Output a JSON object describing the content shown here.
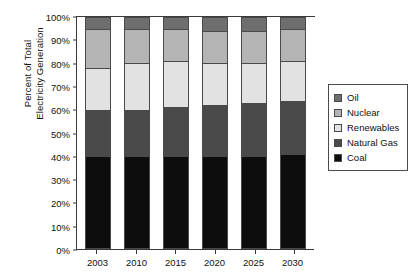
{
  "chart_data": {
    "type": "bar",
    "subtype": "stacked-bar-100-percent",
    "title": "",
    "xlabel": "",
    "ylabel": "Percent of Total\nElectricity Generation",
    "categories": [
      "2003",
      "2010",
      "2015",
      "2020",
      "2025",
      "2030"
    ],
    "ylim": [
      0,
      100
    ],
    "ytick_labels": [
      "0%",
      "10%",
      "20%",
      "30%",
      "40%",
      "50%",
      "60%",
      "70%",
      "80%",
      "90%",
      "100%"
    ],
    "ytick_values": [
      0,
      10,
      20,
      30,
      40,
      50,
      60,
      70,
      80,
      90,
      100
    ],
    "grid": false,
    "legend_position": "right",
    "stack_order_bottom_to_top": [
      "Coal",
      "Natural Gas",
      "Renewables",
      "Nuclear",
      "Oil"
    ],
    "series": [
      {
        "name": "Coal",
        "color": "#0d0d0d",
        "values": [
          40,
          40,
          40,
          40,
          40,
          41
        ]
      },
      {
        "name": "Natural Gas",
        "color": "#4a4a4a",
        "values": [
          20,
          20,
          21,
          22,
          23,
          23
        ]
      },
      {
        "name": "Renewables",
        "color": "#e2e2e2",
        "values": [
          18,
          20,
          20,
          18,
          17,
          17
        ]
      },
      {
        "name": "Nuclear",
        "color": "#b4b4b4",
        "values": [
          17,
          15,
          14,
          14,
          14,
          14
        ]
      },
      {
        "name": "Oil",
        "color": "#6e6e6e",
        "values": [
          5,
          5,
          5,
          6,
          6,
          5
        ]
      }
    ],
    "cumulative_tops": {
      "2003": {
        "Coal": 40,
        "Natural Gas": 60,
        "Renewables": 78,
        "Nuclear": 95,
        "Oil": 100
      },
      "2010": {
        "Coal": 40,
        "Natural Gas": 60,
        "Renewables": 80,
        "Nuclear": 95,
        "Oil": 100
      },
      "2015": {
        "Coal": 40,
        "Natural Gas": 61,
        "Renewables": 81,
        "Nuclear": 95,
        "Oil": 100
      },
      "2020": {
        "Coal": 40,
        "Natural Gas": 62,
        "Renewables": 80,
        "Nuclear": 94,
        "Oil": 100
      },
      "2025": {
        "Coal": 40,
        "Natural Gas": 63,
        "Renewables": 80,
        "Nuclear": 94,
        "Oil": 100
      },
      "2030": {
        "Coal": 41,
        "Natural Gas": 64,
        "Renewables": 81,
        "Nuclear": 95,
        "Oil": 100
      }
    }
  },
  "legend": {
    "items": [
      {
        "label": "Oil",
        "color": "#6e6e6e"
      },
      {
        "label": "Nuclear",
        "color": "#b4b4b4"
      },
      {
        "label": "Renewables",
        "color": "#e2e2e2"
      },
      {
        "label": "Natural Gas",
        "color": "#4a4a4a"
      },
      {
        "label": "Coal",
        "color": "#0d0d0d"
      }
    ]
  },
  "axis": {
    "line_color": "#3a3a3a"
  }
}
